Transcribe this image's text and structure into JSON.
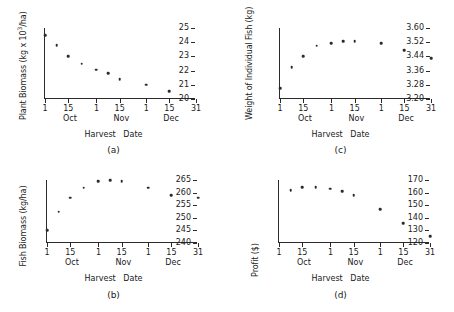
{
  "figure": {
    "shared_xlabel": "Harvest   Date",
    "x_axis": {
      "ticks": [
        {
          "label": "1",
          "day": 0
        },
        {
          "label": "15",
          "day": 14
        },
        {
          "label": "1",
          "day": 31
        },
        {
          "label": "15",
          "day": 45
        },
        {
          "label": "1",
          "day": 61
        },
        {
          "label": "15",
          "day": 75
        },
        {
          "label": "31",
          "day": 91
        }
      ],
      "months": [
        {
          "label": "Oct",
          "day": 15
        },
        {
          "label": "Nov",
          "day": 46
        },
        {
          "label": "Dec",
          "day": 76
        }
      ],
      "xlim": [
        0,
        91
      ]
    }
  },
  "chart_data": [
    {
      "id": "a",
      "type": "scatter",
      "caption": "(a)",
      "title": "",
      "ylabel": "Plant Biomass (kg x 10",
      "ylabel_sup": "3",
      "ylabel_tail": "/ha)",
      "xlabel": "Harvest   Date",
      "ylim": [
        20,
        25
      ],
      "yticks": [
        20,
        21,
        22,
        23,
        24,
        25
      ],
      "ytick_labels": [
        "20",
        "21",
        "22",
        "23",
        "24",
        "25"
      ],
      "x": [
        0,
        7,
        14,
        22,
        31,
        38,
        45,
        61,
        75
      ],
      "y": [
        24.5,
        23.8,
        23.0,
        22.5,
        22.05,
        21.8,
        21.4,
        21.0,
        20.55
      ],
      "x_tick_labels": [
        "1",
        "15",
        "1",
        "15",
        "1",
        "15",
        "31"
      ],
      "month_labels": [
        "Oct",
        "Nov",
        "Dec"
      ]
    },
    {
      "id": "c",
      "type": "scatter",
      "caption": "(c)",
      "title": "",
      "ylabel": "Weight of Individual Fish (kg)",
      "ylabel_sup": "",
      "ylabel_tail": "",
      "xlabel": "Harvest   Date",
      "ylim": [
        3.2,
        3.6
      ],
      "yticks": [
        3.2,
        3.28,
        3.36,
        3.44,
        3.52,
        3.6
      ],
      "ytick_labels": [
        "3.20",
        "3.28",
        "3.36",
        "3.44",
        "3.52",
        "3.60"
      ],
      "x": [
        0,
        7,
        14,
        22,
        31,
        38,
        45,
        61,
        75,
        91
      ],
      "y": [
        3.26,
        3.38,
        3.44,
        3.5,
        3.515,
        3.525,
        3.525,
        3.515,
        3.475,
        3.43
      ],
      "x_tick_labels": [
        "1",
        "15",
        "1",
        "15",
        "1",
        "15",
        "31"
      ],
      "month_labels": [
        "Oct",
        "Nov",
        "Dec"
      ]
    },
    {
      "id": "b",
      "type": "scatter",
      "caption": "(b)",
      "title": "",
      "ylabel": "Fish Biomass (kg/ha)",
      "ylabel_sup": "",
      "ylabel_tail": "",
      "xlabel": "Harvest   Date",
      "ylim": [
        240,
        265
      ],
      "yticks": [
        240,
        245,
        250,
        255,
        260,
        265
      ],
      "ytick_labels": [
        "240",
        "245",
        "250",
        "255",
        "260",
        "265"
      ],
      "x": [
        0,
        7,
        14,
        22,
        31,
        38,
        45,
        61,
        75,
        91
      ],
      "y": [
        245.0,
        252.5,
        258.0,
        262.0,
        264.5,
        265.0,
        264.5,
        262.0,
        259.0,
        258.0
      ],
      "x_tick_labels": [
        "1",
        "15",
        "1",
        "15",
        "1",
        "15",
        "31"
      ],
      "month_labels": [
        "Oct",
        "Nov",
        "Dec"
      ]
    },
    {
      "id": "d",
      "type": "scatter",
      "caption": "(d)",
      "title": "",
      "ylabel": "Profit ($)",
      "ylabel_sup": "",
      "ylabel_tail": "",
      "xlabel": "Harvest   Date",
      "ylim": [
        120,
        170
      ],
      "yticks": [
        120,
        130,
        140,
        150,
        160,
        170
      ],
      "ytick_labels": [
        "120",
        "130",
        "140",
        "150",
        "160",
        "170"
      ],
      "x": [
        7,
        14,
        22,
        31,
        38,
        45,
        61,
        75,
        91
      ],
      "y": [
        162.0,
        164.5,
        164.5,
        163.0,
        161.0,
        158.0,
        147.0,
        135.5,
        125.5
      ],
      "x_tick_labels": [
        "1",
        "15",
        "1",
        "15",
        "1",
        "15",
        "31"
      ],
      "month_labels": [
        "Oct",
        "Nov",
        "Dec"
      ]
    }
  ]
}
